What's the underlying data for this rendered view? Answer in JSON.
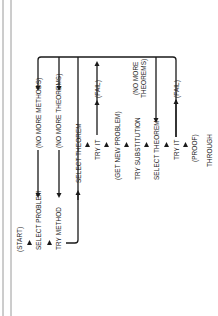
{
  "diagram": {
    "orientation": "rotated-90-ccw",
    "colors": {
      "ink": "#1a1a1a",
      "border": "#9a9a9a",
      "background": "#ffffff"
    },
    "nodes": [
      {
        "id": "start",
        "label": "(START)"
      },
      {
        "id": "select-problem",
        "label": "SELECT PROBLEM"
      },
      {
        "id": "try-method",
        "label": "TRY METHOD"
      },
      {
        "id": "select-theorem-1",
        "label": "SELECT THEOREM"
      },
      {
        "id": "try-it-1",
        "label": "TRY IT"
      },
      {
        "id": "get-new-problem",
        "label": "(GET NEW PROBLEM)"
      },
      {
        "id": "try-substitution",
        "label": "TRY SUBSTITUTION"
      },
      {
        "id": "select-theorem-2",
        "label": "SELECT THEOREM"
      },
      {
        "id": "try-it-2",
        "label": "TRY IT"
      },
      {
        "id": "proof",
        "label": "(PROOF)"
      },
      {
        "id": "through",
        "label": "THROUGH"
      }
    ],
    "branches": [
      {
        "id": "no-more-methods",
        "label": "(NO MORE METHODS)"
      },
      {
        "id": "no-more-theorems-1",
        "label": "(NO MORE THEOREMS)"
      },
      {
        "id": "fail-1",
        "label": "(FAIL)"
      },
      {
        "id": "no-more-theorems-2-line1",
        "label": "(NO MORE"
      },
      {
        "id": "no-more-theorems-2-line2",
        "label": "THEOREMS)"
      },
      {
        "id": "fail-2",
        "label": "(FAIL)"
      }
    ]
  }
}
